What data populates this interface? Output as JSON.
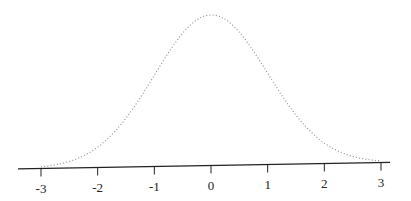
{
  "chart_data": {
    "type": "line",
    "title": "",
    "xlabel": "",
    "ylabel": "",
    "series": [
      {
        "name": "standard normal density",
        "style": "dotted",
        "x": [
          -3.0,
          -2.75,
          -2.5,
          -2.25,
          -2.0,
          -1.75,
          -1.5,
          -1.25,
          -1.0,
          -0.75,
          -0.5,
          -0.25,
          0.0,
          0.25,
          0.5,
          0.75,
          1.0,
          1.25,
          1.5,
          1.75,
          2.0,
          2.25,
          2.5,
          2.75,
          3.0
        ],
        "values": [
          0.0044,
          0.0091,
          0.0175,
          0.0317,
          0.054,
          0.0863,
          0.1295,
          0.1826,
          0.242,
          0.3011,
          0.3521,
          0.3867,
          0.3989,
          0.3867,
          0.3521,
          0.3011,
          0.242,
          0.1826,
          0.1295,
          0.0863,
          0.054,
          0.0317,
          0.0175,
          0.0091,
          0.0044
        ]
      }
    ],
    "x_ticks": [
      -3,
      -2,
      -1,
      0,
      1,
      2,
      3
    ],
    "x_tick_labels": [
      "-3",
      "-2",
      "-1",
      "0",
      "1",
      "2",
      "3"
    ],
    "xlim": [
      -3,
      3
    ],
    "ylim": [
      0,
      0.4
    ],
    "grid": false,
    "legend": "none",
    "y_axis_shown": false
  },
  "colors": {
    "curve": "#8a8a8a",
    "axis": "#222222"
  }
}
